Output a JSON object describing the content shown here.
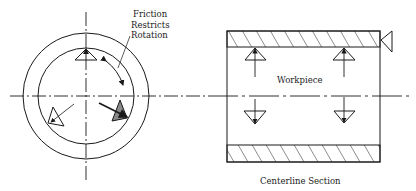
{
  "diagram": {
    "labels": {
      "friction_line1": "Friction",
      "friction_line2": "Restricts",
      "friction_line3": "Rotation",
      "workpiece": "Workpiece",
      "section": "Centerline Section"
    },
    "views": [
      {
        "name": "end-view",
        "description": "Circular end view with three locating pads and rotation arrow"
      },
      {
        "name": "centerline-section",
        "description": "Hatched tube section with four pads and radial force arrows"
      }
    ],
    "colors": {
      "line": "#1a1a1a",
      "hatch": "#1a1a1a",
      "shaded_pad": "#888888",
      "background": "#ffffff"
    }
  }
}
